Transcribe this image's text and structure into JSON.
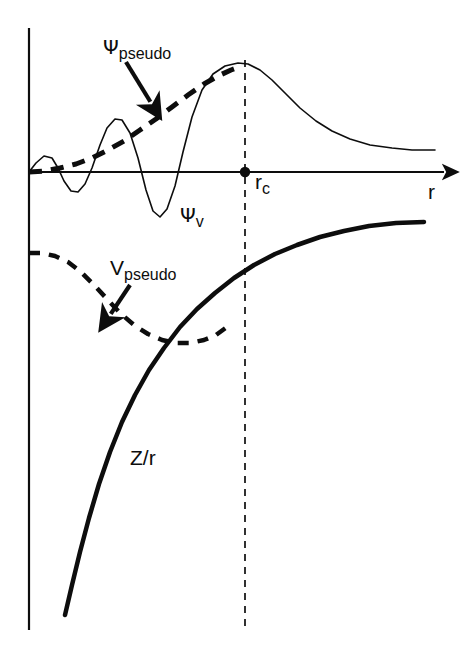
{
  "figure": {
    "background_color": "#ffffff",
    "ink_color": "#0d0d0d",
    "width": 473,
    "height": 647
  },
  "labels": {
    "psi_pseudo": {
      "symbol": "Ψ",
      "subscript": "pseudo"
    },
    "psi_v": {
      "symbol": "Ψ",
      "subscript": "v"
    },
    "v_pseudo": {
      "symbol": "V",
      "subscript": "pseudo"
    },
    "r_c": {
      "symbol": "r",
      "subscript": "c"
    },
    "r_axis": {
      "symbol": "r",
      "subscript": ""
    },
    "z_over_r": {
      "symbol": "Z/r",
      "subscript": ""
    }
  },
  "chart_data": {
    "type": "line",
    "xlabel": "r",
    "ylabel": "",
    "grid": false,
    "legend": "inline-annotations",
    "axes": {
      "origin_px": [
        29,
        172
      ],
      "x_axis_end_px": [
        450,
        172
      ],
      "y_axis_top_px": [
        29,
        28
      ],
      "y_axis_bottom_px": [
        29,
        630
      ],
      "x_axis_arrow": true,
      "x_axis_tick_labels": [
        "r_c"
      ],
      "y_axis_tick_labels": []
    },
    "markers": [
      {
        "name": "core-radius-point",
        "label": "r_c",
        "x_px": 245,
        "y_px": 172,
        "style": "filled-dot"
      }
    ],
    "guides": [
      {
        "name": "core-radius-line",
        "label": "r_c",
        "style": "dashed-vertical",
        "x_px": 245,
        "y_top_px": 60,
        "y_bottom_px": 630
      }
    ],
    "series": [
      {
        "name": "Ψ_v",
        "label": "Ψ_v",
        "description": "All-electron valence wavefunction: oscillates rapidly inside r_c, matches pseudo outside",
        "style": "solid-thin",
        "linewidth": 1.6,
        "points_px": [
          [
            29,
            172
          ],
          [
            36,
            163
          ],
          [
            44,
            156
          ],
          [
            52,
            158
          ],
          [
            58,
            168
          ],
          [
            64,
            181
          ],
          [
            71,
            191
          ],
          [
            78,
            192
          ],
          [
            85,
            184
          ],
          [
            92,
            168
          ],
          [
            100,
            145
          ],
          [
            107,
            128
          ],
          [
            115,
            119
          ],
          [
            122,
            120
          ],
          [
            130,
            133
          ],
          [
            138,
            158
          ],
          [
            146,
            190
          ],
          [
            153,
            211
          ],
          [
            160,
            217
          ],
          [
            167,
            209
          ],
          [
            175,
            186
          ],
          [
            183,
            152
          ],
          [
            192,
            117
          ],
          [
            202,
            90
          ],
          [
            213,
            74
          ],
          [
            225,
            66
          ],
          [
            238,
            63
          ],
          [
            248,
            64
          ],
          [
            260,
            70
          ],
          [
            272,
            80
          ],
          [
            286,
            94
          ],
          [
            300,
            108
          ],
          [
            316,
            121
          ],
          [
            332,
            131
          ],
          [
            350,
            139
          ],
          [
            370,
            145
          ],
          [
            392,
            148
          ],
          [
            412,
            150
          ],
          [
            435,
            150
          ]
        ]
      },
      {
        "name": "Ψ_pseudo",
        "label": "Ψ_pseudo",
        "description": "Smooth nodeless pseudo-wavefunction, matches Ψ_v beyond r_c",
        "style": "dashed-thick",
        "linewidth": 5,
        "dash": "13 9",
        "points_px": [
          [
            29,
            172
          ],
          [
            44,
            171
          ],
          [
            60,
            168
          ],
          [
            76,
            164
          ],
          [
            92,
            158
          ],
          [
            108,
            150
          ],
          [
            124,
            141
          ],
          [
            140,
            130
          ],
          [
            156,
            119
          ],
          [
            172,
            107
          ],
          [
            188,
            95
          ],
          [
            204,
            84
          ],
          [
            218,
            76
          ],
          [
            231,
            70
          ],
          [
            242,
            66
          ]
        ]
      },
      {
        "name": "V_pseudo",
        "label": "V_pseudo",
        "description": "Smooth pseudopotential: finite at origin, merges with -Z/r beyond r_c",
        "style": "dashed-thick",
        "linewidth": 4.5,
        "dash": "11 9",
        "points_px": [
          [
            29,
            253
          ],
          [
            42,
            253
          ],
          [
            55,
            256
          ],
          [
            68,
            262
          ],
          [
            81,
            272
          ],
          [
            94,
            285
          ],
          [
            107,
            299
          ],
          [
            120,
            313
          ],
          [
            134,
            325
          ],
          [
            148,
            334
          ],
          [
            162,
            340
          ],
          [
            176,
            343
          ],
          [
            190,
            343
          ],
          [
            204,
            340
          ],
          [
            216,
            335
          ],
          [
            227,
            327
          ]
        ]
      },
      {
        "name": "Z/r",
        "label": "Z/r",
        "description": "Bare Coulomb potential of the nucleus, diverging near the origin",
        "style": "solid-thick",
        "linewidth": 4.5,
        "points_px": [
          [
            65,
            615
          ],
          [
            72,
            585
          ],
          [
            80,
            552
          ],
          [
            89,
            518
          ],
          [
            99,
            484
          ],
          [
            110,
            452
          ],
          [
            122,
            422
          ],
          [
            135,
            395
          ],
          [
            149,
            370
          ],
          [
            164,
            348
          ],
          [
            180,
            327
          ],
          [
            197,
            309
          ],
          [
            215,
            293
          ],
          [
            234,
            278
          ],
          [
            254,
            265
          ],
          [
            275,
            254
          ],
          [
            297,
            245
          ],
          [
            320,
            237
          ],
          [
            344,
            231
          ],
          [
            369,
            226
          ],
          [
            396,
            223
          ],
          [
            424,
            222
          ]
        ]
      }
    ],
    "annotation_arrows": [
      {
        "name": "psi-pseudo-arrow",
        "from_label": "Ψ_pseudo",
        "from_px": [
          126,
          62
        ],
        "to_px": [
          153,
          106
        ]
      },
      {
        "name": "v-pseudo-arrow",
        "from_label": "V_pseudo",
        "from_px": [
          130,
          285
        ],
        "to_px": [
          108,
          318
        ]
      }
    ]
  }
}
